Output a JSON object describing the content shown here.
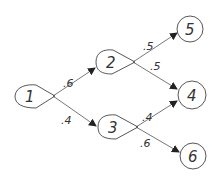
{
  "diagram": {
    "type": "decision-tree",
    "nodes": [
      {
        "id": "1",
        "label": "1",
        "shape": "decision-teardrop"
      },
      {
        "id": "2",
        "label": "2",
        "shape": "decision-teardrop"
      },
      {
        "id": "3",
        "label": "3",
        "shape": "decision-teardrop"
      },
      {
        "id": "4",
        "label": "4",
        "shape": "circle"
      },
      {
        "id": "5",
        "label": "5",
        "shape": "circle"
      },
      {
        "id": "6",
        "label": "6",
        "shape": "circle"
      }
    ],
    "edges": [
      {
        "from": "1",
        "to": "2",
        "label": ".6"
      },
      {
        "from": "1",
        "to": "3",
        "label": ".4"
      },
      {
        "from": "2",
        "to": "5",
        "label": ".5"
      },
      {
        "from": "2",
        "to": "4",
        "label": ".5"
      },
      {
        "from": "3",
        "to": "4",
        "label": ".4"
      },
      {
        "from": "3",
        "to": "6",
        "label": ".6"
      }
    ]
  }
}
